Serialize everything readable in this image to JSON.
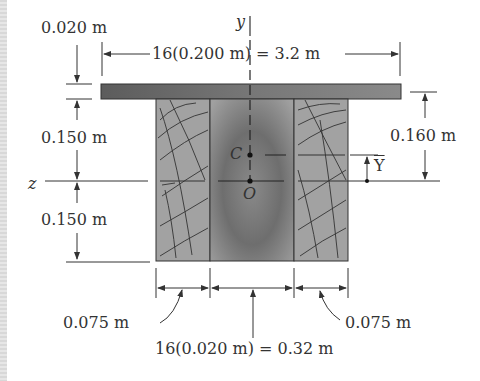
{
  "diagram": {
    "type": "composite beam cross-section",
    "axes": {
      "y_label": "y",
      "z_label": "z"
    },
    "points": {
      "centroid": "C",
      "origin": "O"
    },
    "centroid_offset_label": "Y",
    "dimensions": {
      "plate_thickness": "0.020 m",
      "plate_width": "16(0.200 m) = 3.2 m",
      "upper_height": "0.150 m",
      "lower_height": "0.150 m",
      "plate_to_axis": "0.160 m",
      "left_wood_width": "0.075 m",
      "right_wood_width": "0.075 m",
      "steel_core_width": "16(0.020 m) = 0.32 m"
    },
    "colors": {
      "plate": "#6a6a6a",
      "steel_core": "#7a7a7a",
      "wood": "#9c9c9c",
      "lines": "#333333",
      "background": "#ffffff"
    }
  }
}
